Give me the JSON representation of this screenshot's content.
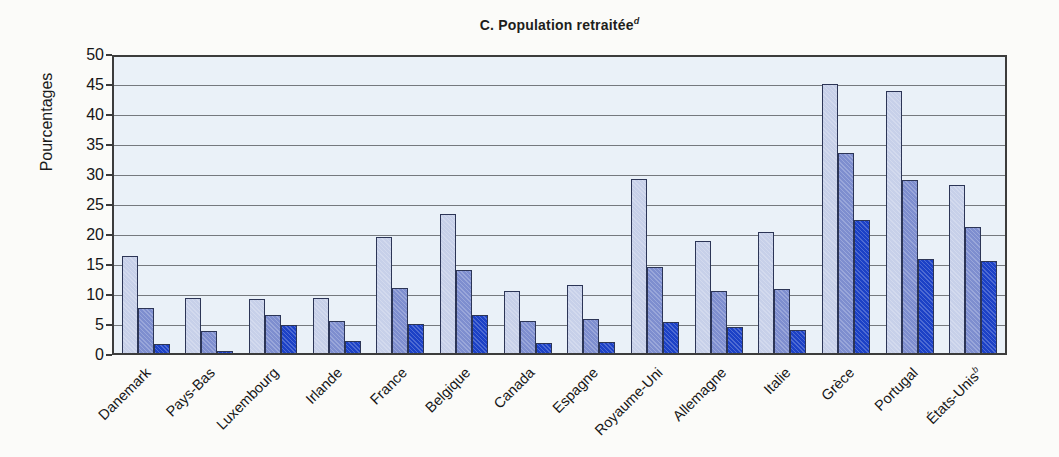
{
  "chart": {
    "title": "C. Population retraitée",
    "title_superscript": "d",
    "ylabel": "Pourcentages"
  },
  "colors": {
    "plot_background": "#eaf1f8",
    "gridline": "#75797e",
    "plot_border": "#3c3c3c",
    "bar_border": "#2c3556",
    "series_light": "#c7d0e9",
    "series_medium": "#7e8ecf",
    "series_dark": "#1c41c6"
  },
  "chart_data": {
    "type": "bar",
    "ylabel": "Pourcentages",
    "xlabel": "",
    "ylim": [
      0,
      50
    ],
    "ytick_step": 5,
    "yticks": [
      0,
      5,
      10,
      15,
      20,
      25,
      30,
      35,
      40,
      45,
      50
    ],
    "grid": true,
    "legend": "none",
    "categories": [
      {
        "label": "Danemark",
        "sup": ""
      },
      {
        "label": "Pays-Bas",
        "sup": ""
      },
      {
        "label": "Luxembourg",
        "sup": ""
      },
      {
        "label": "Irlande",
        "sup": ""
      },
      {
        "label": "France",
        "sup": ""
      },
      {
        "label": "Belgique",
        "sup": ""
      },
      {
        "label": "Canada",
        "sup": ""
      },
      {
        "label": "Espagne",
        "sup": ""
      },
      {
        "label": "Royaume-Uni",
        "sup": ""
      },
      {
        "label": "Allemagne",
        "sup": ""
      },
      {
        "label": "Italie",
        "sup": ""
      },
      {
        "label": "Grèce",
        "sup": ""
      },
      {
        "label": "Portugal",
        "sup": ""
      },
      {
        "label": "États-Unis",
        "sup": "b"
      }
    ],
    "series": [
      {
        "name": "light-blue-bar",
        "color": "#c7d0e9",
        "values": [
          16.1,
          9.2,
          9.0,
          9.2,
          19.3,
          23.2,
          10.4,
          11.4,
          29.0,
          18.6,
          20.2,
          44.9,
          43.6,
          28.0
        ]
      },
      {
        "name": "medium-blue-bar",
        "color": "#7e8ecf",
        "values": [
          7.5,
          3.6,
          6.4,
          5.4,
          10.8,
          13.9,
          5.3,
          5.6,
          14.4,
          10.4,
          10.7,
          33.3,
          28.9,
          21.0
        ]
      },
      {
        "name": "dark-blue-bar",
        "color": "#1c41c6",
        "values": [
          1.5,
          0.4,
          4.6,
          2.0,
          4.8,
          6.4,
          1.6,
          1.8,
          5.1,
          4.4,
          3.9,
          22.1,
          15.6,
          15.4
        ]
      }
    ]
  }
}
